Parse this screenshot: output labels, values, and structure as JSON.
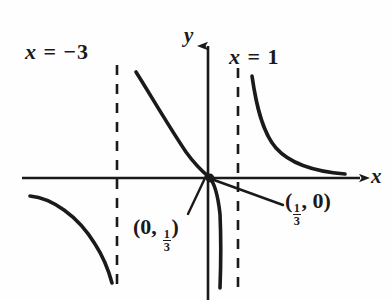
{
  "figure": {
    "kind": "rational-function-graph",
    "background_color": "#fefefe",
    "ink_color": "#1a1a1a"
  },
  "axes": {
    "x_label": "x",
    "y_label": "y",
    "origin_px": [
      208,
      178
    ],
    "x_axis_y_px": 178,
    "y_axis_x_px": 208,
    "x_axis_from_px": 22,
    "x_axis_to_px": 366,
    "y_axis_from_px": 38,
    "y_axis_to_px": 300,
    "arrowheads": [
      "right",
      "up"
    ]
  },
  "asymptotes": [
    {
      "name": "left-vertical-asymptote",
      "label_text": "x = −3",
      "label_var": "x",
      "label_rel": "=",
      "label_value": "−3",
      "x_px": 117,
      "top_px": 65,
      "bottom_px": 287,
      "style": "dashed"
    },
    {
      "name": "right-vertical-asymptote",
      "label_text": "x = 1",
      "label_var": "x",
      "label_rel": "=",
      "label_value": "1",
      "x_px": 238,
      "top_px": 68,
      "bottom_px": 289,
      "style": "dashed"
    }
  ],
  "points": [
    {
      "name": "y-intercept",
      "label_open": "(0, ",
      "label_numerator": "1",
      "label_denominator": "3",
      "label_close": ")",
      "label_text": "(0, 1/3)",
      "leader_from_px": [
        188,
        214
      ],
      "leader_to_px": [
        206,
        176
      ]
    },
    {
      "name": "x-intercept",
      "label_open": "(",
      "label_numerator": "1",
      "label_denominator": "3",
      "label_close": ", 0)",
      "label_text": "(1/3, 0)",
      "leader_from_px": [
        283,
        205
      ],
      "leader_to_px": [
        214,
        180
      ]
    }
  ],
  "curve_branches": [
    {
      "name": "left-branch",
      "description": "decreasing arc in third quadrant approaching x = -3 from the left",
      "path": "M 30,196 C 52,198 78,216 95,244 C 104,258 108,268 112,283"
    },
    {
      "name": "middle-branch",
      "description": "descends from near x = -3 through the intercepts then plunges toward x = 1",
      "path": "M 136,72 C 150,94 166,122 186,152 C 196,166 203,172 209,177 C 214,182 218,196 220,214 C 221,236 221,262 220,288"
    },
    {
      "name": "right-branch",
      "description": "falls from x = 1 asymptote and flattens toward the x-axis",
      "path": "M 252,76 C 256,104 262,132 276,148 C 292,166 320,172 345,174"
    }
  ]
}
